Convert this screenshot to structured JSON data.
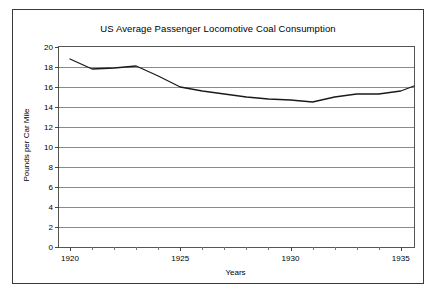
{
  "chart_data": {
    "type": "line",
    "title": "US Average Passenger Locomotive Coal Consumption",
    "xlabel": "Years",
    "ylabel": "Pounds per Car Mile",
    "xlim": [
      1919.5,
      1935.6
    ],
    "ylim": [
      0,
      20
    ],
    "ytick_step": 2,
    "yticks": [
      0,
      2,
      4,
      6,
      8,
      10,
      12,
      14,
      16,
      18,
      20
    ],
    "ytick_labels": [
      "0",
      "2",
      "4",
      "6",
      "8",
      "10",
      "12",
      "14",
      "16",
      "18",
      "20"
    ],
    "xticks": [
      1920,
      1925,
      1930,
      1935
    ],
    "xtick_labels": [
      "1920",
      "1925",
      "1930",
      "1935"
    ],
    "xtick_minor": [
      1921,
      1922,
      1923,
      1924,
      1926,
      1927,
      1928,
      1929,
      1931,
      1932,
      1933,
      1934
    ],
    "grid": "horizontal",
    "legend": "none",
    "line_color": "#1a1a1a",
    "line_width": 1.3,
    "x": [
      1920,
      1921,
      1922,
      1923,
      1924,
      1925,
      1926,
      1927,
      1928,
      1929,
      1930,
      1931,
      1932,
      1933,
      1934,
      1935
    ],
    "values": [
      18.8,
      17.8,
      17.9,
      18.1,
      17.1,
      16.0,
      15.6,
      15.3,
      15.0,
      14.8,
      14.7,
      14.5,
      15.0,
      15.3,
      15.3,
      15.6
    ],
    "series": [
      {
        "name": "Pounds per Car Mile",
        "values": [
          18.8,
          17.8,
          17.9,
          18.1,
          17.1,
          16.0,
          15.6,
          15.3,
          15.0,
          14.8,
          14.7,
          14.5,
          15.0,
          15.3,
          15.3,
          15.6
        ]
      }
    ],
    "endpoint_value": 16.1,
    "endpoint_x": 1935.6
  }
}
